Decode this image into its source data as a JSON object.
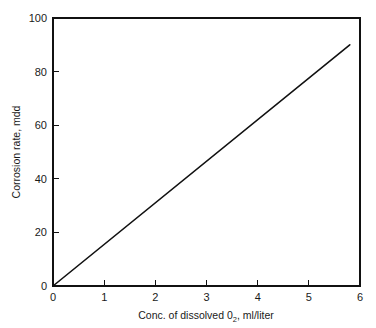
{
  "chart_data": {
    "type": "line",
    "title": "",
    "subtitle": "",
    "xlabel_parts": {
      "before": "Conc. of dissolved 0",
      "subscript": "2",
      "after": ", ml/liter"
    },
    "xlabel": "Conc. of dissolved 0₂, ml/liter",
    "ylabel": "Corrosion rate, mdd",
    "xlim": [
      0,
      6
    ],
    "ylim": [
      0,
      100
    ],
    "xticks": [
      0,
      1,
      2,
      3,
      4,
      5,
      6
    ],
    "yticks": [
      0,
      20,
      40,
      60,
      80,
      100
    ],
    "xtick_labels": [
      "0",
      "1",
      "2",
      "3",
      "4",
      "5",
      "6"
    ],
    "ytick_labels": [
      "0",
      "20",
      "40",
      "60",
      "80",
      "100"
    ],
    "grid": false,
    "legend": null,
    "tick_direction": "in",
    "series": [
      {
        "name": "Corrosion rate vs dissolved oxygen",
        "color": "#111111",
        "x": [
          0,
          5.8
        ],
        "y": [
          0,
          90
        ],
        "slope": 15.5,
        "intercept": 0,
        "points": [
          {
            "x": 0,
            "y": 0
          },
          {
            "x": 1,
            "y": 15.5
          },
          {
            "x": 2,
            "y": 31
          },
          {
            "x": 3,
            "y": 46.5
          },
          {
            "x": 4,
            "y": 62
          },
          {
            "x": 5,
            "y": 77.5
          },
          {
            "x": 5.8,
            "y": 90
          }
        ]
      }
    ],
    "colors": {
      "line": "#111111",
      "axis": "#111111",
      "text": "#1a1a1a",
      "background": "#ffffff"
    }
  }
}
